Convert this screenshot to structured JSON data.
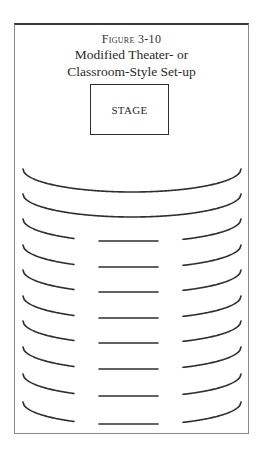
{
  "figure": {
    "label": "Figure 3-10",
    "title_line1": "Modified Theater- or",
    "title_line2": "Classroom-Style Set-up"
  },
  "stage": {
    "label": "STAGE"
  },
  "seating": {
    "arc": {
      "cx": 132,
      "half_width": 109,
      "depth": 23
    },
    "split": {
      "left_end_x": 74,
      "center_start_x": 99,
      "center_end_x": 158,
      "right_start_x": 183,
      "center_offset": 22
    },
    "rows": [
      {
        "type": "full",
        "top": 169
      },
      {
        "type": "full",
        "top": 194
      },
      {
        "type": "split",
        "top": 219
      },
      {
        "type": "split",
        "top": 245
      },
      {
        "type": "split",
        "top": 270
      },
      {
        "type": "split",
        "top": 296
      },
      {
        "type": "split",
        "top": 321
      },
      {
        "type": "split",
        "top": 347
      },
      {
        "type": "split",
        "top": 374
      },
      {
        "type": "split",
        "top": 402
      }
    ]
  }
}
